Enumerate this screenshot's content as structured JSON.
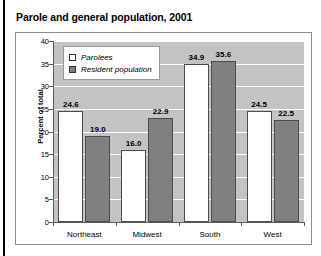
{
  "chart_data": {
    "type": "bar",
    "title": "Parole and general population, 2001",
    "xlabel": "",
    "ylabel": "Percent of total",
    "categories": [
      "Northeast",
      "Midwest",
      "South",
      "West"
    ],
    "series": [
      {
        "name": "Parolees",
        "values": [
          24.6,
          16.0,
          34.9,
          24.5
        ],
        "color": "#ffffff"
      },
      {
        "name": "Resident population",
        "values": [
          19.0,
          22.9,
          35.6,
          22.5
        ],
        "color": "#808080"
      }
    ],
    "value_labels": [
      [
        "24.6",
        "19.0"
      ],
      [
        "16.0",
        "22.9"
      ],
      [
        "34.9",
        "35.6"
      ],
      [
        "24.5",
        "22.5"
      ]
    ],
    "ylim": [
      0,
      40
    ],
    "ytick_values": [
      40,
      35,
      30,
      25,
      20,
      15,
      10,
      5,
      0
    ],
    "ytick_labels": [
      "40",
      "35",
      "30",
      "25",
      "20",
      "15",
      "10",
      "5",
      "0"
    ],
    "grid": true,
    "legend_position": "upper-left-inside",
    "plot_background": "#c3c3c3",
    "gridline_color": "#ffffff"
  }
}
